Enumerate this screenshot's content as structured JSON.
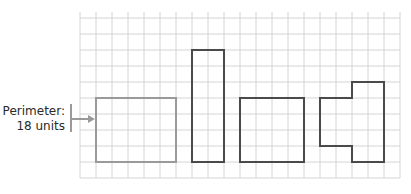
{
  "diagram": {
    "label": {
      "line1": "Perimeter:",
      "line2": "18 units"
    },
    "grid": {
      "origin_x": 80,
      "origin_y": 18,
      "cell": 16,
      "cols": 20,
      "rows": 10,
      "line_color": "#d4d4d4"
    },
    "shapes": [
      {
        "name": "highlighted-rectangle",
        "color": "#9a9a9a",
        "points": [
          [
            1,
            5
          ],
          [
            6,
            5
          ],
          [
            6,
            9
          ],
          [
            1,
            9
          ]
        ]
      },
      {
        "name": "tall-rectangle",
        "color": "#4a4a4a",
        "points": [
          [
            7,
            2
          ],
          [
            9,
            2
          ],
          [
            9,
            9
          ],
          [
            7,
            9
          ]
        ]
      },
      {
        "name": "wide-rectangle",
        "color": "#4a4a4a",
        "points": [
          [
            10,
            5
          ],
          [
            14,
            5
          ],
          [
            14,
            9
          ],
          [
            10,
            9
          ]
        ]
      },
      {
        "name": "notched-shape",
        "color": "#4a4a4a",
        "points": [
          [
            15,
            5
          ],
          [
            17,
            5
          ],
          [
            17,
            4
          ],
          [
            19,
            4
          ],
          [
            19,
            9
          ],
          [
            17,
            9
          ],
          [
            17,
            8
          ],
          [
            15,
            8
          ]
        ]
      }
    ]
  }
}
